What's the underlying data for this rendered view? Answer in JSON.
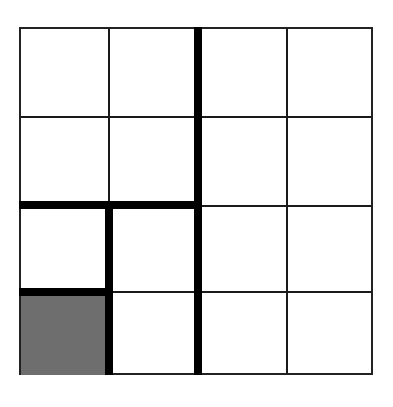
{
  "diagram": {
    "type": "grid",
    "rows": 4,
    "columns": 4,
    "fill_color": "#6e6e6e",
    "line_color": "#1a1a1a",
    "thick_line_color": "#000000",
    "shaded_cells": [
      {
        "row": 4,
        "col": 1
      }
    ],
    "nested_squares": [
      {
        "size": "1x1",
        "anchor": "bottom-left"
      },
      {
        "size": "2x2",
        "anchor": "bottom-left"
      },
      {
        "size": "4x4",
        "anchor": "bottom-left"
      }
    ]
  }
}
